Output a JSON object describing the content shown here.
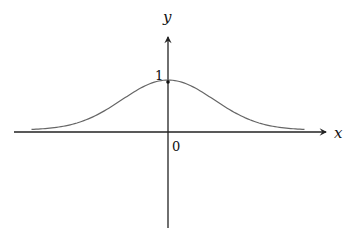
{
  "diagram": {
    "title": "",
    "function": "gaussian bell curve y = e^{-x^2}",
    "x_axis_label": "x",
    "y_axis_label": "y",
    "origin_label": "0",
    "peak_label": "1",
    "peak_value": 1,
    "x_domain": [
      -2.1,
      2.1
    ],
    "colors": {
      "axis": "#222222",
      "curve": "#666666",
      "point": "#111111"
    }
  }
}
